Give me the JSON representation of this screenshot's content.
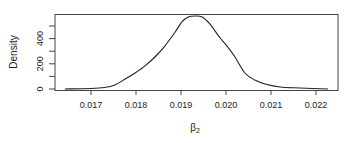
{
  "chart_data": {
    "type": "line",
    "title": "",
    "xlabel": "β2",
    "xlabel_display": "β",
    "xlabel_subscript": "2",
    "ylabel": "Density",
    "xlim": [
      0.0163,
      0.02235
    ],
    "ylim": [
      -10,
      600
    ],
    "x_ticks": [
      0.017,
      0.018,
      0.019,
      0.02,
      0.021,
      0.022
    ],
    "x_tick_labels": [
      "0.017",
      "0.018",
      "0.019",
      "0.020",
      "0.021",
      "0.022"
    ],
    "y_ticks": [
      0,
      100,
      200,
      300,
      400,
      500
    ],
    "y_tick_labels": [
      "0",
      "200",
      "400"
    ],
    "y_labeled_ticks": [
      0,
      200,
      400
    ],
    "grid": false,
    "legend": null,
    "series": [
      {
        "name": "density",
        "color": "#222222",
        "x": [
          0.01642,
          0.017,
          0.0173,
          0.01753,
          0.01776,
          0.01798,
          0.0182,
          0.01842,
          0.01864,
          0.01887,
          0.01902,
          0.01916,
          0.01931,
          0.01947,
          0.01964,
          0.01987,
          0.02004,
          0.0202,
          0.02042,
          0.02064,
          0.02087,
          0.0212,
          0.02164,
          0.02227
        ],
        "y": [
          0,
          4,
          12,
          32,
          79,
          127,
          183,
          254,
          341,
          452,
          532,
          571,
          579,
          571,
          516,
          405,
          333,
          254,
          127,
          71,
          40,
          16,
          8,
          0
        ]
      }
    ]
  }
}
